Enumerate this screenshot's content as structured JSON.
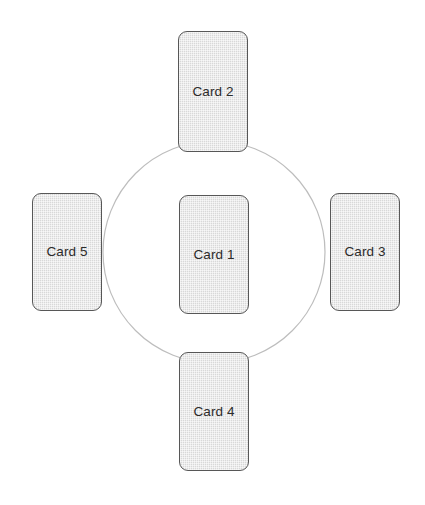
{
  "canvas": {
    "width": 425,
    "height": 505,
    "background_color": "#ffffff"
  },
  "diagram": {
    "type": "radial-card-layout",
    "ring": {
      "name": "circle-guide",
      "center_x": 214,
      "center_y": 252,
      "radius": 111,
      "stroke_color": "#bdbdbd",
      "stroke_width": 1.2,
      "fill": "none"
    },
    "card_style": {
      "fill_color": "#d8d8d8",
      "border_color": "#575757",
      "text_color": "#2b2b2b",
      "corner_radius": 9,
      "texture": "fine-crosshatch"
    },
    "cards": [
      {
        "id": "card-1",
        "label": "Card 1",
        "position": "center",
        "x": 179,
        "y": 195,
        "width": 70,
        "height": 119
      },
      {
        "id": "card-2",
        "label": "Card 2",
        "position": "top",
        "x": 178,
        "y": 31,
        "width": 70,
        "height": 121
      },
      {
        "id": "card-3",
        "label": "Card 3",
        "position": "right",
        "x": 330,
        "y": 193,
        "width": 70,
        "height": 118
      },
      {
        "id": "card-4",
        "label": "Card 4",
        "position": "bottom",
        "x": 179,
        "y": 352,
        "width": 70,
        "height": 119
      },
      {
        "id": "card-5",
        "label": "Card 5",
        "position": "left",
        "x": 32,
        "y": 193,
        "width": 70,
        "height": 118
      }
    ]
  }
}
